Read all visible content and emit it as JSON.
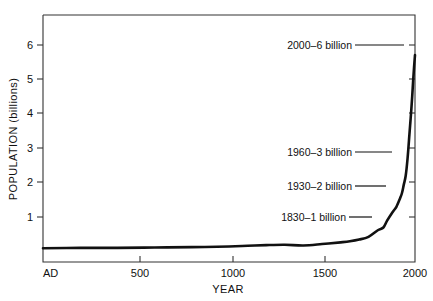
{
  "chart_data": {
    "type": "line",
    "title": "",
    "xlabel": "YEAR",
    "ylabel": "POPULATION (billions)",
    "xlim": [
      0,
      2000
    ],
    "ylim": [
      0,
      6.7
    ],
    "grid": false,
    "legend": "none",
    "x_ticks": [
      {
        "value": 0,
        "label": "AD"
      },
      {
        "value": 500,
        "label": "500"
      },
      {
        "value": 1000,
        "label": "1000"
      },
      {
        "value": 1500,
        "label": "1500"
      },
      {
        "value": 2000,
        "label": "2000"
      }
    ],
    "y_ticks": [
      {
        "value": 1,
        "label": "1"
      },
      {
        "value": 2,
        "label": "2"
      },
      {
        "value": 3,
        "label": "3"
      },
      {
        "value": 4,
        "label": "4"
      },
      {
        "value": 5,
        "label": "5"
      },
      {
        "value": 6,
        "label": "6"
      }
    ],
    "series": [
      {
        "name": "World population",
        "x": [
          0,
          200,
          400,
          600,
          800,
          1000,
          1100,
          1200,
          1300,
          1400,
          1500,
          1600,
          1650,
          1700,
          1750,
          1800,
          1830,
          1850,
          1880,
          1900,
          1920,
          1930,
          1940,
          1950,
          1960,
          1970,
          1975,
          1980,
          1985,
          1990,
          1995,
          2000
        ],
        "y": [
          0.4,
          0.41,
          0.41,
          0.42,
          0.43,
          0.45,
          0.47,
          0.49,
          0.5,
          0.48,
          0.52,
          0.57,
          0.6,
          0.65,
          0.73,
          0.92,
          1.0,
          1.2,
          1.45,
          1.6,
          1.85,
          2.0,
          2.25,
          2.5,
          3.0,
          3.7,
          4.05,
          4.4,
          4.8,
          5.25,
          5.65,
          6.0
        ]
      }
    ],
    "annotations": [
      {
        "text": "2000–6 billion",
        "year": 2000,
        "population": 6
      },
      {
        "text": "1960–3 billion",
        "year": 1960,
        "population": 3
      },
      {
        "text": "1930–2 billion",
        "year": 1930,
        "population": 2
      },
      {
        "text": "1830–1 billion",
        "year": 1830,
        "population": 1
      }
    ],
    "colors": {
      "curve": "#111111",
      "frame": "#333333",
      "background": "#ffffff",
      "text": "#111111"
    }
  }
}
